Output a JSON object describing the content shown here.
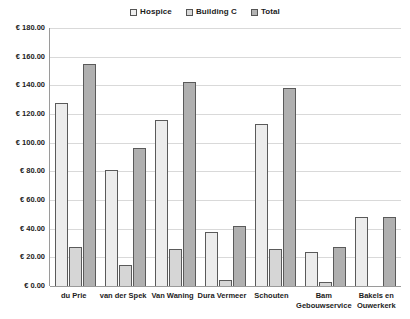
{
  "chart_data": {
    "type": "bar",
    "title": "",
    "xlabel": "",
    "ylabel": "",
    "ylim": [
      0,
      180
    ],
    "ytick_step": 20,
    "currency_symbol": "€",
    "grid": true,
    "legend_position": "top-center",
    "categories": [
      "du Prie",
      "van der Spek",
      "Van Waning",
      "Dura Vermeer",
      "Schouten",
      "Bam\nGebouwservice",
      "Bakels en\nOuwerkerk"
    ],
    "ytick_labels": [
      "€ 180.00",
      "€ 160.00",
      "€ 140.00",
      "€ 120.00",
      "€ 100.00",
      "€ 80.00",
      "€ 60.00",
      "€ 40.00",
      "€ 20.00",
      "€ 0.00"
    ],
    "ytick_values": [
      180,
      160,
      140,
      120,
      100,
      80,
      60,
      40,
      20,
      0
    ],
    "series": [
      {
        "name": "Hospice",
        "color": "#ececec",
        "values": [
          128.0,
          81.0,
          116.0,
          38.0,
          113.0,
          24.0,
          48.0
        ]
      },
      {
        "name": "Building C",
        "color": "#d6d6d6",
        "values": [
          27.0,
          15.0,
          26.0,
          4.0,
          26.0,
          3.0,
          0.0
        ]
      },
      {
        "name": "Total",
        "color": "#b0b0b0",
        "values": [
          155.0,
          96.0,
          142.0,
          42.0,
          138.0,
          27.0,
          48.0
        ]
      }
    ]
  },
  "legend": {
    "items": [
      {
        "label": "Hospice"
      },
      {
        "label": "Building C"
      },
      {
        "label": "Total"
      }
    ]
  }
}
